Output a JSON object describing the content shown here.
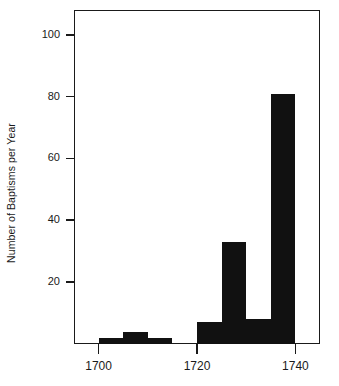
{
  "chart_data": {
    "type": "bar",
    "title": "",
    "subtitle": "",
    "xlabel": "",
    "ylabel": "Number of Baptisms per Year",
    "xlim": [
      1695,
      1745
    ],
    "ylim": [
      0,
      108
    ],
    "bin_width": 5,
    "grid": false,
    "legend": null,
    "annotations": [],
    "xticks": [
      {
        "value": 1700,
        "label": "1700"
      },
      {
        "value": 1720,
        "label": "1720"
      },
      {
        "value": 1740,
        "label": "1740"
      }
    ],
    "yticks": [
      {
        "value": 20,
        "label": "20"
      },
      {
        "value": 40,
        "label": "40"
      },
      {
        "value": 60,
        "label": "60"
      },
      {
        "value": 80,
        "label": "80"
      },
      {
        "value": 100,
        "label": "100"
      }
    ],
    "categories": [
      "1700-1705",
      "1705-1710",
      "1710-1715",
      "1715-1720",
      "1720-1725",
      "1725-1730",
      "1730-1735",
      "1735-1740"
    ],
    "bins": [
      {
        "start": 1700,
        "end": 1705,
        "value": 2
      },
      {
        "start": 1705,
        "end": 1710,
        "value": 4
      },
      {
        "start": 1710,
        "end": 1715,
        "value": 2
      },
      {
        "start": 1715,
        "end": 1720,
        "value": 0
      },
      {
        "start": 1720,
        "end": 1725,
        "value": 7
      },
      {
        "start": 1725,
        "end": 1730,
        "value": 33
      },
      {
        "start": 1730,
        "end": 1735,
        "value": 8
      },
      {
        "start": 1735,
        "end": 1740,
        "value": 81
      }
    ],
    "values": [
      2,
      4,
      2,
      0,
      7,
      33,
      8,
      81
    ],
    "bar_color": "#111111",
    "axis_color": "#1a1a1a",
    "background_color": "#ffffff"
  }
}
